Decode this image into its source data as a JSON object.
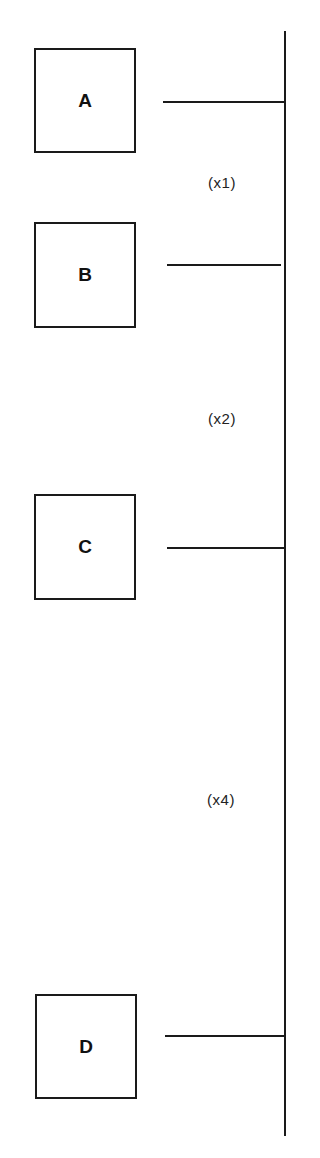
{
  "diagram": {
    "type": "bus-connection-diagram",
    "colors": {
      "line": "#1a1a1a",
      "background": "#ffffff"
    },
    "bus": {
      "orientation": "vertical"
    },
    "nodes": [
      {
        "id": "A",
        "label": "A"
      },
      {
        "id": "B",
        "label": "B"
      },
      {
        "id": "C",
        "label": "C"
      },
      {
        "id": "D",
        "label": "D"
      }
    ],
    "spacing_labels": [
      {
        "between": [
          "A",
          "B"
        ],
        "label": "(x1)"
      },
      {
        "between": [
          "B",
          "C"
        ],
        "label": "(x2)"
      },
      {
        "between": [
          "C",
          "D"
        ],
        "label": "(x4)"
      }
    ]
  }
}
